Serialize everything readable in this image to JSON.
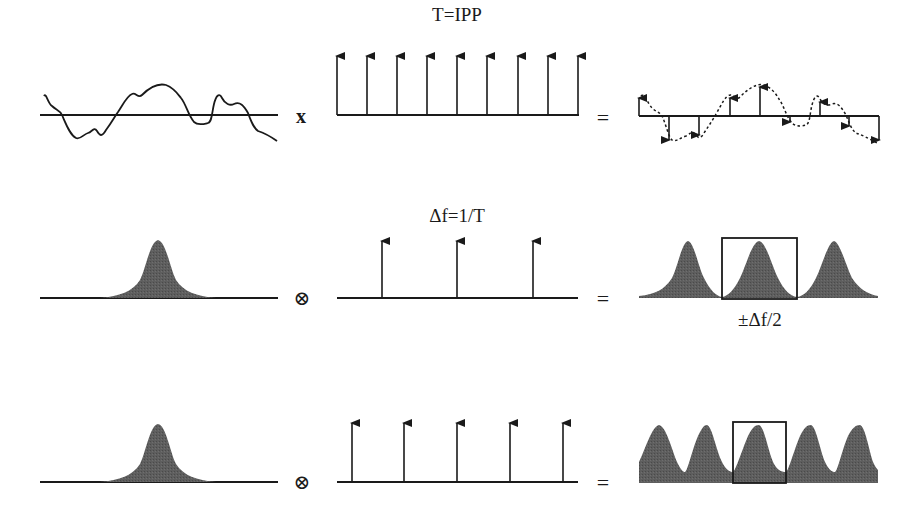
{
  "labels": {
    "row1_pulse_label": "T=IPP",
    "row2_pulse_label": "Δf=1/T",
    "row2_result_label": "±Δf/2"
  },
  "operators": {
    "row1_multiply": "x",
    "row1_equals": "=",
    "row2_convolve": "⊗",
    "row2_equals": "=",
    "row3_convolve": "⊗",
    "row3_equals": "="
  },
  "rows": [
    {
      "name": "time-domain",
      "input": "continuous signal",
      "kernel": "pulse train",
      "kernel_pulse_count": 9,
      "result": "sampled signal (dashed signal with sample arrows)"
    },
    {
      "name": "frequency-domain-wide-spacing",
      "input": "single spectrum peak",
      "kernel": "spectral comb",
      "kernel_pulse_count": 3,
      "result": "3 replicated spectra, box marking Nyquist interval"
    },
    {
      "name": "frequency-domain-narrow-spacing",
      "input": "single spectrum peak",
      "kernel": "spectral comb",
      "kernel_pulse_count": 5,
      "result": "5 overlapping replicated spectra (aliasing), box marking Nyquist interval"
    }
  ],
  "colors": {
    "ink": "#1a1a1a",
    "fill": "#5a5a5a",
    "background": "#ffffff"
  }
}
